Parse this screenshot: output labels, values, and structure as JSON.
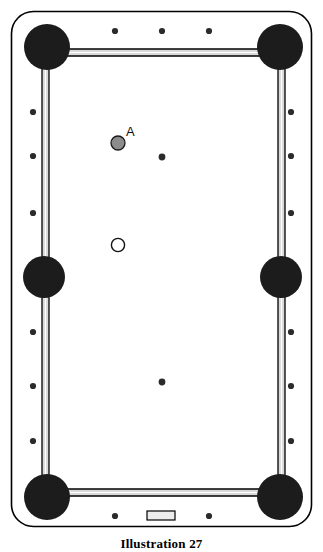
{
  "figure": {
    "caption": "Illustration 27",
    "type": "diagram"
  },
  "colors": {
    "pocket": "#1c1c1c",
    "rail_face": "#d9d9d9",
    "rail_edge": "#000000",
    "frame_line": "#000000",
    "cloth": "#ffffff",
    "diamond": "#2b2b2b",
    "ball_a_fill": "#8c8c8c",
    "ball_a_stroke": "#1a1a1a",
    "cue_ball_fill": "#ffffff",
    "cue_ball_stroke": "#111111",
    "plate_fill": "#ececec"
  },
  "table": {
    "frame": {
      "x": 11,
      "y": 11,
      "width": 301,
      "height": 516,
      "corner_radius": 22
    },
    "playing_area": {
      "x": 47,
      "y": 47,
      "width": 233,
      "height": 450
    },
    "orientation": "portrait"
  },
  "pockets": [
    {
      "name": "pocket-top-left",
      "cx": 47,
      "cy": 47,
      "r": 23,
      "kind": "corner"
    },
    {
      "name": "pocket-top-right",
      "cx": 280,
      "cy": 47,
      "r": 23,
      "kind": "corner"
    },
    {
      "name": "pocket-side-left",
      "cx": 44,
      "cy": 277,
      "r": 21,
      "kind": "side"
    },
    {
      "name": "pocket-side-right",
      "cx": 281,
      "cy": 277,
      "r": 21,
      "kind": "side"
    },
    {
      "name": "pocket-bottom-left",
      "cx": 47,
      "cy": 497,
      "r": 23,
      "kind": "corner"
    },
    {
      "name": "pocket-bottom-right",
      "cx": 280,
      "cy": 497,
      "r": 23,
      "kind": "corner"
    }
  ],
  "diamonds": {
    "radius": 3.1,
    "top": [
      {
        "cx": 115,
        "cy": 31
      },
      {
        "cx": 162,
        "cy": 31
      },
      {
        "cx": 209,
        "cy": 31
      }
    ],
    "bottom": [
      {
        "cx": 115,
        "cy": 516
      },
      {
        "cx": 209,
        "cy": 516
      }
    ],
    "left": [
      {
        "cx": 33,
        "cy": 112
      },
      {
        "cx": 33,
        "cy": 156
      },
      {
        "cx": 33,
        "cy": 213
      },
      {
        "cx": 33,
        "cy": 332
      },
      {
        "cx": 33,
        "cy": 386
      },
      {
        "cx": 33,
        "cy": 441
      }
    ],
    "right": [
      {
        "cx": 291,
        "cy": 112
      },
      {
        "cx": 291,
        "cy": 156
      },
      {
        "cx": 291,
        "cy": 213
      },
      {
        "cx": 291,
        "cy": 332
      },
      {
        "cx": 291,
        "cy": 386
      },
      {
        "cx": 291,
        "cy": 441
      }
    ]
  },
  "table_spots": [
    {
      "name": "spot-upper-center",
      "cx": 162,
      "cy": 157,
      "r": 3.4
    },
    {
      "name": "spot-lower-center",
      "cx": 162,
      "cy": 382,
      "r": 3.4
    }
  ],
  "balls": [
    {
      "name": "ball-a",
      "label": "A",
      "cx": 118,
      "cy": 143,
      "r": 7,
      "fill": "#8c8c8c",
      "stroke": "#1a1a1a",
      "label_x": 128,
      "label_y": 132
    },
    {
      "name": "cue-ball",
      "label": "",
      "cx": 118,
      "cy": 245,
      "r": 6.6,
      "fill": "#ffffff",
      "stroke": "#111111",
      "label_x": 0,
      "label_y": 0
    }
  ],
  "name_plate": {
    "x": 147,
    "y": 511,
    "width": 28,
    "height": 9
  }
}
